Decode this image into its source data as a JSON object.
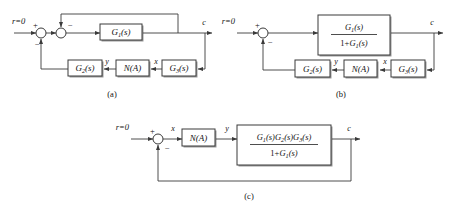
{
  "figure": {
    "background_color": "#ffffff",
    "line_color": "#3a3a3a",
    "text_color": "#111111",
    "box_fill": "#ffffff",
    "shadow_color": "#9a9a9a"
  },
  "diagrams": [
    {
      "id": "a",
      "caption": "(a)",
      "input_label": "r=0",
      "output_label": "c",
      "summing_junctions": [
        {
          "name": "sum-1",
          "signs": [
            "+",
            "−"
          ]
        },
        {
          "name": "sum-2",
          "signs": [
            "−"
          ]
        }
      ],
      "blocks": [
        {
          "name": "g1-block",
          "text": "G1(s)",
          "base": "G",
          "sub": "1",
          "tail": "(s)"
        },
        {
          "name": "g2-block",
          "text": "G2(s)",
          "base": "G",
          "sub": "2",
          "tail": "(s)"
        },
        {
          "name": "na-block",
          "text": "N(A)",
          "base": "N",
          "sub": "",
          "tail": "(A)"
        },
        {
          "name": "g3-block",
          "text": "G3(s)",
          "base": "G",
          "sub": "3",
          "tail": "(s)"
        }
      ],
      "signal_labels": [
        {
          "name": "signal-y",
          "text": "y"
        },
        {
          "name": "signal-x",
          "text": "x"
        }
      ]
    },
    {
      "id": "b",
      "caption": "(b)",
      "input_label": "r=0",
      "output_label": "c",
      "summing_junctions": [
        {
          "name": "sum-1",
          "signs": [
            "+",
            "−"
          ]
        }
      ],
      "blocks": [
        {
          "name": "closed-loop-block",
          "numerator": "G1(s)",
          "denominator": "1+G1(s)",
          "num_base": "G",
          "num_sub": "1",
          "num_tail": "(s)",
          "den_prefix": "1+",
          "den_base": "G",
          "den_sub": "1",
          "den_tail": "(s)"
        },
        {
          "name": "g2-block",
          "text": "G2(s)",
          "base": "G",
          "sub": "2",
          "tail": "(s)"
        },
        {
          "name": "na-block",
          "text": "N(A)",
          "base": "N",
          "sub": "",
          "tail": "(A)"
        },
        {
          "name": "g3-block",
          "text": "G3(s)",
          "base": "G",
          "sub": "3",
          "tail": "(s)"
        }
      ],
      "signal_labels": [
        {
          "name": "signal-y",
          "text": "y"
        },
        {
          "name": "signal-x",
          "text": "x"
        }
      ]
    },
    {
      "id": "c",
      "caption": "(c)",
      "input_label": "r=0",
      "output_label": "c",
      "summing_junctions": [
        {
          "name": "sum-1",
          "signs": [
            "+",
            "−"
          ]
        }
      ],
      "blocks": [
        {
          "name": "na-block",
          "text": "N(A)",
          "base": "N",
          "sub": "",
          "tail": "(A)"
        },
        {
          "name": "combined-transfer-block",
          "numerator": "G1(s)G2(s)G3(s)",
          "denominator": "1+G1(s)",
          "den_prefix": "1+",
          "den_base": "G",
          "den_sub": "1",
          "den_tail": "(s)"
        }
      ],
      "signal_labels": [
        {
          "name": "signal-x",
          "text": "x"
        },
        {
          "name": "signal-y",
          "text": "y"
        }
      ]
    }
  ],
  "text": {
    "r_zero": "r=0",
    "c": "c",
    "x": "x",
    "y": "y",
    "plus": "+",
    "minus": "−",
    "one_plus": "1+",
    "g": "G",
    "n": "N",
    "s_paren": "(s)",
    "a_paren": "(A)",
    "sub1": "1",
    "sub2": "2",
    "sub3": "3",
    "cap_a": "(a)",
    "cap_b": "(b)",
    "cap_c": "(c)"
  }
}
